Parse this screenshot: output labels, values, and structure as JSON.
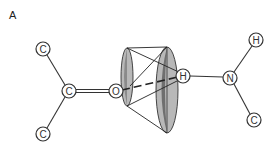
{
  "figure": {
    "panel_label": "A",
    "atoms": {
      "c_top_left": "C",
      "c_center": "C",
      "c_bottom_left": "C",
      "o_carbonyl": "O",
      "h_bridge": "H",
      "n_amide": "N",
      "h_top_right": "H",
      "c_bottom_right": "C"
    },
    "colors": {
      "line": "#333333",
      "cone_light": "#b8b8b8",
      "cone_dark": "#7a7a7a"
    }
  }
}
